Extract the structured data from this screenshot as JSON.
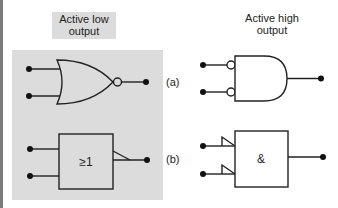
{
  "columns": {
    "left_title": [
      "Active low",
      "output"
    ],
    "right_title": [
      "Active high",
      "output"
    ]
  },
  "rows": [
    {
      "tag": "(a)",
      "left_gate": "NOR (distinctive shape, output bubble)",
      "right_gate": "AND (distinctive shape, inverted inputs)"
    },
    {
      "tag": "(b)",
      "left_gate": "IEC OR box with active-low output indicator",
      "right_gate": "IEC AND box with active-low input indicators"
    }
  ],
  "symbols": {
    "or_box_label": "≥1",
    "and_box_label": "&"
  },
  "colors": {
    "panel": "#dcdcdc",
    "line": "#222222",
    "left_border": "#7a7a7a"
  }
}
